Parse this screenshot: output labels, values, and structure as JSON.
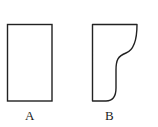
{
  "figure": {
    "shapes": [
      {
        "id": "A",
        "label": "A",
        "kind": "rectangle"
      },
      {
        "id": "B",
        "label": "B",
        "kind": "curved-profile"
      }
    ],
    "stroke_color": "#222222",
    "background": "#ffffff"
  }
}
